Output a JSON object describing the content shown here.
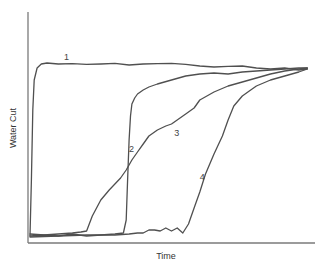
{
  "chart_data": {
    "type": "line",
    "title": "",
    "xlabel": "Time",
    "ylabel": "Water Cut",
    "xlim": [
      0,
      100
    ],
    "ylim": [
      0,
      100
    ],
    "grid": false,
    "legend": "none (curves labeled inline 1-4)",
    "series": [
      {
        "name": "1",
        "label_pos": [
          12,
          90
        ],
        "x": [
          0,
          0.5,
          1,
          1.5,
          2.5,
          4,
          6,
          10,
          15,
          20,
          25,
          30,
          35,
          40,
          45,
          50,
          55,
          60,
          65,
          70,
          75,
          80,
          85,
          90,
          95,
          98
        ],
        "y": [
          2,
          30,
          65,
          80,
          86,
          88,
          88.5,
          88,
          88.2,
          87.8,
          88,
          88.3,
          87.5,
          88,
          88.2,
          88.3,
          87.8,
          87,
          86.5,
          86.8,
          87,
          86,
          85.5,
          86,
          85,
          85.5
        ]
      },
      {
        "name": "2",
        "label_pos": [
          35,
          44
        ],
        "x": [
          0,
          5,
          10,
          15,
          20,
          25,
          30,
          33,
          34,
          34.5,
          35,
          35.5,
          36,
          37,
          38,
          40,
          42,
          45,
          50,
          55,
          60,
          65,
          70,
          75,
          80,
          85,
          90,
          95,
          98
        ],
        "y": [
          2,
          2.5,
          2,
          3,
          2,
          2.5,
          3,
          3.5,
          10,
          30,
          50,
          62,
          68,
          71,
          73,
          75,
          76.5,
          78,
          80,
          82,
          83,
          83.5,
          83,
          84,
          84.5,
          85,
          85.5,
          86,
          86
        ]
      },
      {
        "name": "3",
        "label_pos": [
          51,
          52
        ],
        "x": [
          0,
          5,
          10,
          15,
          18,
          20,
          22,
          25,
          28,
          30,
          32,
          34,
          36,
          38,
          40,
          42,
          45,
          48,
          50,
          52,
          55,
          58,
          60,
          65,
          70,
          75,
          80,
          85,
          90,
          95,
          98
        ],
        "y": [
          3,
          2.5,
          3,
          3.5,
          4,
          4.5,
          12,
          20,
          25,
          28,
          31,
          35,
          40,
          44,
          48,
          52,
          55,
          57,
          58,
          60,
          63,
          66,
          70,
          74,
          77,
          79,
          81,
          83,
          84.5,
          85.5,
          86
        ]
      },
      {
        "name": "4",
        "label_pos": [
          60,
          30
        ],
        "x": [
          0,
          10,
          20,
          30,
          35,
          38,
          40,
          42,
          44,
          46,
          48,
          50,
          52,
          54,
          56,
          58,
          60,
          62,
          65,
          68,
          70,
          72,
          75,
          78,
          80,
          85,
          90,
          95,
          98
        ],
        "y": [
          1.5,
          2,
          2.5,
          2.5,
          3,
          3.5,
          3.5,
          5,
          5,
          4.5,
          6,
          4.5,
          6,
          3.5,
          8,
          16,
          24,
          33,
          43,
          52,
          60,
          67,
          72,
          75,
          77,
          80,
          82,
          84,
          85.5
        ]
      }
    ]
  }
}
